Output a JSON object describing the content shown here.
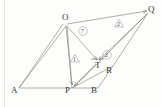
{
  "figure": {
    "type": "geometry-diagram",
    "background_color": "#fdfdfc",
    "stroke_color": "#8d8d8a",
    "label_color": "#3a3a38",
    "points": {
      "A": {
        "label": "A",
        "x": 14,
        "y": 91
      },
      "P": {
        "label": "P",
        "x": 68,
        "y": 91
      },
      "B": {
        "label": "B",
        "x": 94,
        "y": 91
      },
      "O": {
        "label": "O",
        "x": 66,
        "y": 21
      },
      "Q": {
        "label": "Q",
        "x": 150,
        "y": 13
      },
      "T": {
        "label": "T",
        "x": 98,
        "y": 64
      },
      "R": {
        "label": "R",
        "x": 109,
        "y": 69
      }
    },
    "point_labels": {
      "A": "A",
      "P": "P",
      "B": "B",
      "O": "O",
      "Q": "Q",
      "T": "T",
      "R": "R"
    },
    "annotations": [
      {
        "name": "triangle-marker-1",
        "text": "1",
        "shape": "triangle",
        "x": 74,
        "y": 59
      },
      {
        "name": "triangle-marker-2",
        "text": "2",
        "shape": "triangle",
        "x": 118,
        "y": 24
      },
      {
        "name": "circle-marker-7",
        "text": "7",
        "shape": "circle",
        "x": 82,
        "y": 32
      },
      {
        "name": "circle-marker-2",
        "text": "2",
        "shape": "circle",
        "x": 106,
        "y": 56
      }
    ],
    "arrow_targets": [
      "P",
      "T",
      "Q"
    ]
  }
}
